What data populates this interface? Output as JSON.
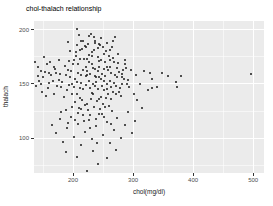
{
  "title": "chol-thalach relationship",
  "chart_data": {
    "type": "scatter",
    "title": "chol-thalach relationship",
    "xlabel": "chol(mg/dl)",
    "ylabel": "thalach",
    "xlim": [
      135,
      518
    ],
    "ylim": [
      68,
      208
    ],
    "x_ticks": [
      200,
      300,
      400,
      500
    ],
    "y_ticks": [
      100,
      150,
      200
    ],
    "x_minor_gridlines": [
      150,
      250,
      350,
      450
    ],
    "y_minor_gridlines": [
      75,
      125,
      175
    ],
    "grid": true,
    "legend": "none",
    "panel_color": "#ebebeb",
    "point_color": "#1a1a1a",
    "points": [
      [
        197,
        162
      ],
      [
        203,
        155
      ],
      [
        209,
        168
      ],
      [
        214,
        151
      ],
      [
        219,
        173
      ],
      [
        224,
        158
      ],
      [
        229,
        146
      ],
      [
        233,
        165
      ],
      [
        238,
        152
      ],
      [
        243,
        171
      ],
      [
        248,
        159
      ],
      [
        252,
        144
      ],
      [
        257,
        166
      ],
      [
        262,
        153
      ],
      [
        267,
        174
      ],
      [
        271,
        148
      ],
      [
        276,
        161
      ],
      [
        281,
        156
      ],
      [
        286,
        168
      ],
      [
        290,
        150
      ],
      [
        199,
        141
      ],
      [
        205,
        176
      ],
      [
        211,
        137
      ],
      [
        216,
        163
      ],
      [
        221,
        149
      ],
      [
        226,
        170
      ],
      [
        231,
        142
      ],
      [
        236,
        157
      ],
      [
        241,
        175
      ],
      [
        246,
        138
      ],
      [
        251,
        164
      ],
      [
        256,
        150
      ],
      [
        261,
        172
      ],
      [
        266,
        143
      ],
      [
        270,
        158
      ],
      [
        275,
        169
      ],
      [
        280,
        139
      ],
      [
        285,
        155
      ],
      [
        289,
        165
      ],
      [
        294,
        147
      ],
      [
        181,
        152
      ],
      [
        186,
        167
      ],
      [
        190,
        144
      ],
      [
        194,
        171
      ],
      [
        178,
        159
      ],
      [
        174,
        148
      ],
      [
        170,
        164
      ],
      [
        166,
        153
      ],
      [
        162,
        170
      ],
      [
        158,
        146
      ],
      [
        154,
        161
      ],
      [
        150,
        156
      ],
      [
        146,
        150
      ],
      [
        142,
        166
      ],
      [
        185,
        138
      ],
      [
        189,
        158
      ],
      [
        193,
        149
      ],
      [
        176,
        172
      ],
      [
        168,
        141
      ],
      [
        160,
        160
      ],
      [
        202,
        147
      ],
      [
        208,
        160
      ],
      [
        212,
        173
      ],
      [
        217,
        145
      ],
      [
        222,
        166
      ],
      [
        227,
        153
      ],
      [
        232,
        176
      ],
      [
        237,
        148
      ],
      [
        242,
        162
      ],
      [
        247,
        155
      ],
      [
        253,
        170
      ],
      [
        258,
        141
      ],
      [
        263,
        160
      ],
      [
        268,
        151
      ],
      [
        273,
        165
      ],
      [
        277,
        143
      ],
      [
        282,
        159
      ],
      [
        287,
        172
      ],
      [
        291,
        154
      ],
      [
        296,
        163
      ],
      [
        204,
        133
      ],
      [
        210,
        128
      ],
      [
        215,
        135
      ],
      [
        220,
        131
      ],
      [
        225,
        126
      ],
      [
        230,
        136
      ],
      [
        235,
        129
      ],
      [
        240,
        134
      ],
      [
        245,
        127
      ],
      [
        250,
        132
      ],
      [
        255,
        137
      ],
      [
        260,
        130
      ],
      [
        265,
        125
      ],
      [
        228,
        121
      ],
      [
        238,
        118
      ],
      [
        248,
        122
      ],
      [
        218,
        116
      ],
      [
        208,
        123
      ],
      [
        198,
        129
      ],
      [
        188,
        126
      ],
      [
        206,
        186
      ],
      [
        212,
        181
      ],
      [
        222,
        184
      ],
      [
        232,
        179
      ],
      [
        242,
        183
      ],
      [
        252,
        178
      ],
      [
        262,
        181
      ],
      [
        216,
        190
      ],
      [
        236,
        188
      ],
      [
        226,
        177
      ],
      [
        200,
        168
      ],
      [
        207,
        152
      ],
      [
        213,
        158
      ],
      [
        223,
        162
      ],
      [
        234,
        150
      ],
      [
        244,
        166
      ],
      [
        254,
        157
      ],
      [
        264,
        147
      ],
      [
        274,
        156
      ],
      [
        284,
        163
      ],
      [
        195,
        156
      ],
      [
        201,
        172
      ],
      [
        211,
        146
      ],
      [
        221,
        157
      ],
      [
        231,
        168
      ],
      [
        241,
        145
      ],
      [
        251,
        153
      ],
      [
        261,
        166
      ],
      [
        271,
        141
      ],
      [
        281,
        150
      ],
      [
        192,
        163
      ],
      [
        198,
        150
      ],
      [
        206,
        141
      ],
      [
        224,
        173
      ],
      [
        229,
        159
      ],
      [
        239,
        156
      ],
      [
        249,
        148
      ],
      [
        259,
        163
      ],
      [
        269,
        170
      ],
      [
        279,
        146
      ],
      [
        234,
        141
      ],
      [
        244,
        136
      ],
      [
        254,
        129
      ],
      [
        264,
        136
      ],
      [
        214,
        127
      ],
      [
        224,
        132
      ],
      [
        244,
        156
      ],
      [
        236,
        164
      ],
      [
        246,
        172
      ],
      [
        256,
        145
      ],
      [
        206,
        201
      ],
      [
        192,
        189
      ],
      [
        213,
        190
      ],
      [
        220,
        185
      ],
      [
        235,
        193
      ],
      [
        244,
        187
      ],
      [
        250,
        184
      ],
      [
        270,
        193
      ],
      [
        195,
        180
      ],
      [
        205,
        179
      ],
      [
        215,
        182
      ],
      [
        225,
        187
      ],
      [
        235,
        181
      ],
      [
        245,
        186
      ],
      [
        255,
        180
      ],
      [
        265,
        184
      ],
      [
        275,
        178
      ],
      [
        247,
        192
      ],
      [
        257,
        188
      ],
      [
        267,
        190
      ],
      [
        227,
        194
      ],
      [
        237,
        190
      ],
      [
        210,
        195
      ],
      [
        230,
        196
      ],
      [
        260,
        176
      ],
      [
        165,
        112
      ],
      [
        172,
        105
      ],
      [
        178,
        118
      ],
      [
        184,
        97
      ],
      [
        190,
        109
      ],
      [
        196,
        120
      ],
      [
        202,
        101
      ],
      [
        208,
        113
      ],
      [
        214,
        94
      ],
      [
        220,
        106
      ],
      [
        226,
        117
      ],
      [
        232,
        99
      ],
      [
        238,
        111
      ],
      [
        244,
        122
      ],
      [
        250,
        103
      ],
      [
        256,
        115
      ],
      [
        262,
        96
      ],
      [
        268,
        108
      ],
      [
        274,
        119
      ],
      [
        280,
        100
      ],
      [
        286,
        112
      ],
      [
        292,
        124
      ],
      [
        298,
        105
      ],
      [
        304,
        116
      ],
      [
        240,
        96
      ],
      [
        228,
        109
      ],
      [
        216,
        121
      ],
      [
        204,
        117
      ],
      [
        192,
        114
      ],
      [
        180,
        124
      ],
      [
        252,
        120
      ],
      [
        264,
        113
      ],
      [
        223,
        70
      ],
      [
        241,
        76
      ],
      [
        207,
        83
      ],
      [
        257,
        82
      ],
      [
        189,
        87
      ],
      [
        271,
        89
      ],
      [
        233,
        88
      ],
      [
        358,
        157
      ],
      [
        372,
        152
      ],
      [
        380,
        157
      ],
      [
        373,
        147
      ],
      [
        497,
        159
      ],
      [
        328,
        160
      ],
      [
        331,
        146
      ],
      [
        305,
        158
      ],
      [
        312,
        150
      ],
      [
        318,
        162
      ],
      [
        325,
        144
      ],
      [
        332,
        155
      ],
      [
        340,
        147
      ],
      [
        348,
        160
      ],
      [
        306,
        135
      ],
      [
        315,
        128
      ],
      [
        302,
        141
      ],
      [
        136,
        170
      ],
      [
        141,
        157
      ],
      [
        147,
        162
      ],
      [
        152,
        175
      ],
      [
        157,
        168
      ],
      [
        138,
        148
      ],
      [
        144,
        153
      ],
      [
        149,
        143
      ],
      [
        155,
        139
      ],
      [
        160,
        151
      ],
      [
        164,
        158
      ],
      [
        168,
        166
      ],
      [
        172,
        160
      ],
      [
        176,
        154
      ],
      [
        180,
        147
      ]
    ]
  }
}
